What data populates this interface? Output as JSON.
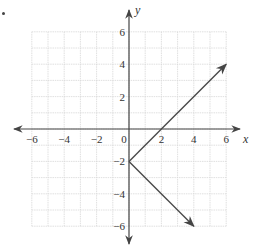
{
  "chart_data": {
    "type": "line",
    "title": "",
    "xlabel": "x",
    "ylabel": "y",
    "xlim": [
      -6,
      6
    ],
    "ylim": [
      -6,
      6
    ],
    "grid": true,
    "grid_step": 1,
    "x_ticks": [
      -6,
      -4,
      -2,
      0,
      2,
      4,
      6
    ],
    "y_ticks": [
      6,
      4,
      2,
      -2,
      -4,
      -6
    ],
    "x_tick_labels": [
      "−6",
      "−4",
      "−2",
      "0",
      "2",
      "4",
      "6"
    ],
    "y_tick_labels": [
      "6",
      "4",
      "2",
      "−2",
      "−4",
      "−6"
    ],
    "series": [
      {
        "name": "upper ray",
        "points": [
          [
            0,
            -2
          ],
          [
            2,
            0
          ],
          [
            6,
            4
          ]
        ],
        "arrow_end": true
      },
      {
        "name": "lower ray",
        "points": [
          [
            0,
            -2
          ],
          [
            4,
            -6
          ]
        ],
        "arrow_end": true
      }
    ],
    "vertex": [
      0,
      -2
    ],
    "line_color": "#4a4a4a",
    "grid_color": "#d8d8d8",
    "axis_color": "#444444"
  },
  "labels": {
    "x_axis": "x",
    "y_axis": "y",
    "origin": "0"
  }
}
